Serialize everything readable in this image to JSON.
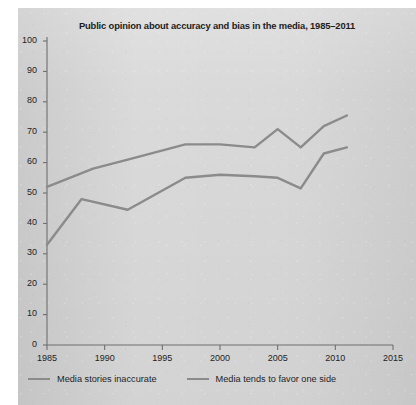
{
  "chart_data": {
    "type": "line",
    "title": "Public opinion about accuracy and bias in the media, 1985–2011",
    "xlabel": "",
    "ylabel": "",
    "xlim": [
      1985,
      2015
    ],
    "ylim": [
      0,
      100
    ],
    "grid": false,
    "legend_position": "bottom-left",
    "xticks": [
      1985,
      1990,
      1995,
      2000,
      2005,
      2010,
      2015
    ],
    "yticks": [
      0,
      10,
      20,
      30,
      40,
      50,
      60,
      70,
      80,
      90,
      100
    ],
    "series": [
      {
        "name": "Media tends to favor one side",
        "color": "#8b8b8b",
        "x": [
          1985,
          1989,
          1992,
          1997,
          2000,
          2003,
          2005,
          2007,
          2009,
          2011
        ],
        "values": [
          52,
          58,
          61,
          66,
          66,
          65,
          71,
          65,
          72,
          75.5
        ]
      },
      {
        "name": "Media stories inaccurate",
        "color": "#8b8b8b",
        "x": [
          1985,
          1988,
          1992,
          1997,
          2000,
          2003,
          2005,
          2007,
          2009,
          2011
        ],
        "values": [
          33,
          48,
          44.5,
          55,
          56,
          55.5,
          55,
          51.5,
          63,
          65
        ]
      }
    ]
  },
  "legend": {
    "items": [
      {
        "label": "Media stories inaccurate",
        "color": "#8b8b8b"
      },
      {
        "label": "Media tends to favor one side",
        "color": "#8b8b8b"
      }
    ]
  },
  "colors": {
    "page_background": "#ffffff",
    "panel_background": "#d6d6d6",
    "line": "#8b8b8b",
    "axis": "#6e6e6e",
    "text": "#1c1c1c"
  }
}
